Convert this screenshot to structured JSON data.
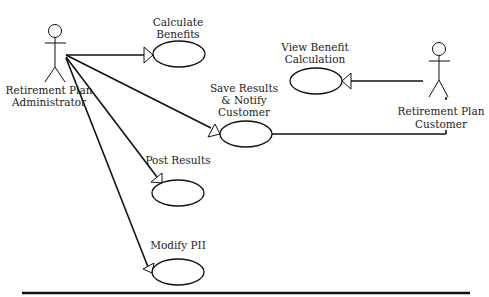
{
  "diagram": {
    "type": "uml-use-case",
    "actors": [
      {
        "id": "admin",
        "label_lines": [
          "Retirement Plan",
          "Administrator"
        ]
      },
      {
        "id": "customer",
        "label_lines": [
          "Retirement Plan",
          "Customer"
        ]
      }
    ],
    "use_cases": [
      {
        "id": "calculate",
        "label_lines": [
          "Calculate",
          "Benefits"
        ]
      },
      {
        "id": "save",
        "label_lines": [
          "Save Results",
          "& Notify",
          "Customer"
        ]
      },
      {
        "id": "post",
        "label_lines": [
          "Post Results"
        ]
      },
      {
        "id": "modify",
        "label_lines": [
          "Modify PII"
        ]
      },
      {
        "id": "view",
        "label_lines": [
          "View Benefit",
          "Calculation"
        ]
      }
    ],
    "associations": [
      {
        "from": "admin",
        "to": "calculate",
        "arrow": "open-triangle"
      },
      {
        "from": "admin",
        "to": "save",
        "arrow": "open-triangle"
      },
      {
        "from": "admin",
        "to": "post",
        "arrow": "open-triangle"
      },
      {
        "from": "admin",
        "to": "modify",
        "arrow": "open-triangle"
      },
      {
        "from": "customer",
        "to": "view",
        "arrow": "open-triangle"
      },
      {
        "from": "customer",
        "to": "save",
        "arrow": "none"
      }
    ],
    "colors": {
      "line": "#111111",
      "text": "#222222",
      "background": "#ffffff"
    }
  }
}
